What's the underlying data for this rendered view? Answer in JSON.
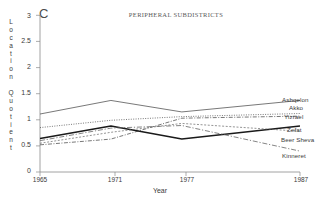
{
  "figure": {
    "panel_label": "C",
    "title": "PERIPHERAL SUBDISTRICTS",
    "xlabel": "Year",
    "ylabel_letters": [
      "L",
      "o",
      "c",
      "a",
      "t",
      "i",
      "o",
      "n",
      "",
      "Q",
      "u",
      "o",
      "t",
      "i",
      "e",
      "n",
      "t"
    ]
  },
  "axes": {
    "yticks": [
      "0",
      "0.5",
      "1",
      "1.5",
      "2",
      "2.5",
      "3"
    ],
    "xticks": [
      "1965",
      "1971",
      "1977",
      "1987"
    ]
  },
  "labels": {
    "ashqelon": "Ashqelon",
    "akko": "Akko",
    "yizrael": "Yizrael",
    "zefat": "Zefat",
    "beer_sheva": "Beer Sheva",
    "kinneret": "Kinneret"
  },
  "chart_data": {
    "type": "line",
    "title": "PERIPHERAL SUBDISTRICTS",
    "panel": "C",
    "xlabel": "Year",
    "ylabel": "Location Quotient",
    "x": [
      1965,
      1971,
      1977,
      1987
    ],
    "xlim": [
      1965,
      1987
    ],
    "ylim": [
      0,
      3
    ],
    "yticks": [
      0,
      0.5,
      1,
      1.5,
      2,
      2.5,
      3
    ],
    "grid": false,
    "legend_position": "right-inline",
    "series": [
      {
        "name": "Ashqelon",
        "values": [
          1.11,
          1.37,
          1.15,
          1.37
        ],
        "style": "solid-thin",
        "color": "#555555"
      },
      {
        "name": "Akko",
        "values": [
          0.85,
          0.99,
          1.06,
          1.12
        ],
        "style": "dotted",
        "color": "#555555"
      },
      {
        "name": "Yizrael",
        "values": [
          0.52,
          0.63,
          1.03,
          1.07
        ],
        "style": "dashdot",
        "color": "#555555"
      },
      {
        "name": "Zefat",
        "values": [
          0.64,
          0.88,
          0.63,
          0.88
        ],
        "style": "solid-thick",
        "color": "#1a1a1a"
      },
      {
        "name": "Beer Sheva",
        "values": [
          0.55,
          0.76,
          0.93,
          0.78
        ],
        "style": "dashed-fine",
        "color": "#666666"
      },
      {
        "name": "Kinneret",
        "values": [
          0.6,
          0.84,
          0.89,
          0.4
        ],
        "style": "dashdot-long",
        "color": "#666666"
      }
    ]
  }
}
